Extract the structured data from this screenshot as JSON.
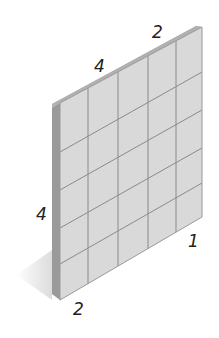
{
  "diagram": {
    "grid": {
      "columns": 5,
      "rows": 5
    },
    "labels": {
      "top_left_edge": "4",
      "top_right_edge": "2",
      "left_height": "4",
      "bottom_left": "2",
      "bottom_right": "1"
    },
    "colors": {
      "face": "#d9d9d9",
      "grid_line": "#8a8a8a",
      "side": "#9a9a9a",
      "top": "#b5b5b5",
      "shadow": "#ececec",
      "label": "#222222"
    }
  }
}
